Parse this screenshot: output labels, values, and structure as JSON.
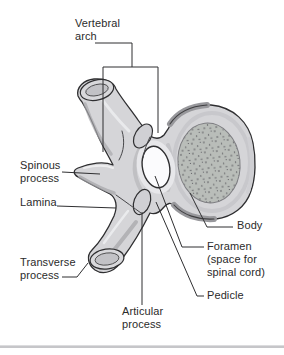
{
  "figure": {
    "labels": {
      "vertebral_arch": "Vertebral\narch",
      "spinous_process": "Spinous\nprocess",
      "lamina": "Lamina",
      "transverse_process": "Transverse\nprocess",
      "articular_process": "Articular\nprocess",
      "body": "Body",
      "foramen": "Foramen\n(space for\nspinal cord)",
      "pedicle": "Pedicle"
    },
    "colors": {
      "background": "#ffffff",
      "bone_fill": "#d5d5d8",
      "bone_outline": "#2f2f31",
      "facet_fill": "#c2c2c6",
      "stipple_fill": "#b9bdb9",
      "stipple_dot": "#54545a",
      "foramen_fill": "#fbfbfd",
      "shadow": "#a6a6aa",
      "highlight": "#edeef0",
      "leader_line": "#2f2f31",
      "label_text": "#2b2b2b",
      "divider": "#c6c6c9"
    }
  }
}
